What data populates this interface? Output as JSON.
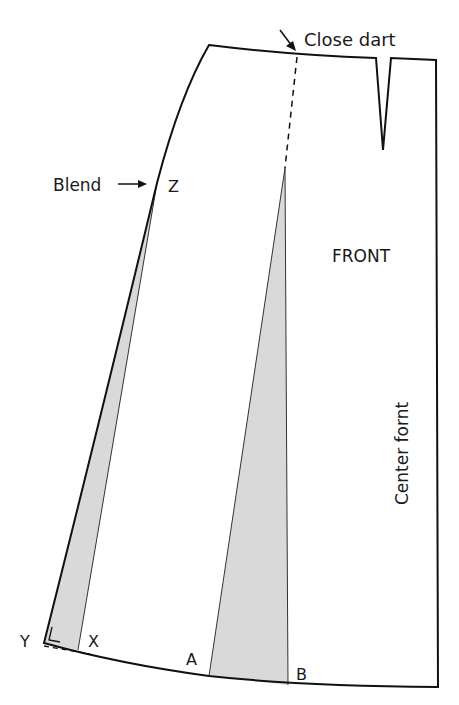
{
  "diagram": {
    "piece_label": "FRONT",
    "center_label": "Center fornt",
    "annotations": {
      "close_dart": "Close dart",
      "blend": "Blend"
    },
    "points": {
      "z": "Z",
      "y": "Y",
      "x": "X",
      "a": "A",
      "b": "B"
    },
    "colors": {
      "outline": "#111111",
      "shade": "#d9d9d9",
      "background": "#ffffff"
    }
  }
}
